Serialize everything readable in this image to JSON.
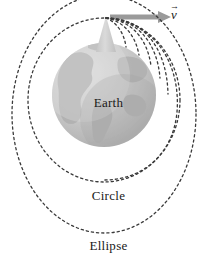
{
  "figure": {
    "name": "newtons-cannonball-orbits",
    "background_color": "#ffffff",
    "width": 217,
    "height": 261
  },
  "labels": {
    "earth": "Earth",
    "circle": "Circle",
    "ellipse": "Ellipse",
    "velocity_symbol": "v",
    "velocity_vector_bar": "→"
  },
  "colors": {
    "earth_fill": "#c9c9c9",
    "earth_land": "#b4b4b4",
    "earth_highlight": "#dcdcdc",
    "earth_shadow": "#b0b0b0",
    "mountain_fill": "#cfcfcf",
    "arrow": "#9a9a9a",
    "dash_stroke": "#3a3a3a",
    "text": "#1a1a1a"
  },
  "earth": {
    "center_x": 104,
    "center_y": 95,
    "radius": 52
  },
  "launch_point": {
    "x": 106,
    "y": 18
  },
  "velocity_arrow": {
    "x1": 110,
    "y1": 17,
    "x2": 166,
    "y2": 17,
    "head_width": 11,
    "head_height": 9
  },
  "mountain": {
    "apex_x": 106,
    "apex_y": 17,
    "base_left_x": 96,
    "base_right_x": 116,
    "base_y": 52
  },
  "orbits": {
    "projectile_arcs": [
      {
        "id": "arc-1",
        "path": "M106,18 C116,22 124,32 126,47"
      },
      {
        "id": "arc-2",
        "path": "M106,18 C122,21 135,33 139,55"
      },
      {
        "id": "arc-3",
        "path": "M106,18 C129,20 147,36 151,66"
      },
      {
        "id": "arc-4",
        "path": "M106,18 C136,19 157,41 160,78"
      },
      {
        "id": "arc-5",
        "path": "M106,18 C143,18 166,48 167,92"
      }
    ],
    "circle_orbit": {
      "id": "circle-orbit",
      "cx": 104,
      "cy": 100,
      "rx": 76,
      "ry": 82
    },
    "ellipse_orbit": {
      "id": "ellipse-orbit",
      "cx": 104,
      "cy": 114,
      "rx": 92,
      "ry": 119
    },
    "inner_partial_orbit": {
      "id": "inner-partial-orbit",
      "path": "M106,18 C152,20 180,60 176,110 C173,152 140,178 104,178"
    }
  }
}
